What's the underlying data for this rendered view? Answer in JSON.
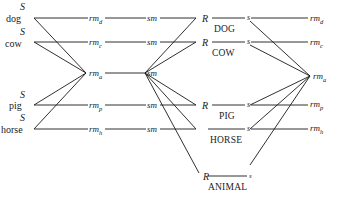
{
  "diagram": {
    "stimuli": [
      {
        "s": "S",
        "word": "dog"
      },
      {
        "s": "S",
        "word": "cow"
      },
      {
        "s": "S",
        "word": "pig"
      },
      {
        "s": "S",
        "word": "horse"
      }
    ],
    "mediators_left": [
      {
        "base": "rm",
        "sub": "d"
      },
      {
        "base": "rm",
        "sub": "c"
      },
      {
        "base": "rm",
        "sub": "a"
      },
      {
        "base": "rm",
        "sub": "p"
      },
      {
        "base": "rm",
        "sub": "h"
      }
    ],
    "sm_label": "sm",
    "responses": [
      {
        "r": "R",
        "word": "DOG",
        "s": "s"
      },
      {
        "r": "R",
        "word": "COW",
        "s": "s"
      },
      {
        "r": "R",
        "word": "PIG",
        "s": "s"
      },
      {
        "r": "",
        "word": "HORSE",
        "s": "s"
      },
      {
        "r": "R",
        "word": "ANIMAL",
        "s": "s"
      }
    ],
    "mediators_right": [
      {
        "base": "rm",
        "sub": "d"
      },
      {
        "base": "rm",
        "sub": "c"
      },
      {
        "base": "rm",
        "sub": "a"
      },
      {
        "base": "rm",
        "sub": "p"
      },
      {
        "base": "rm",
        "sub": "h"
      }
    ]
  }
}
